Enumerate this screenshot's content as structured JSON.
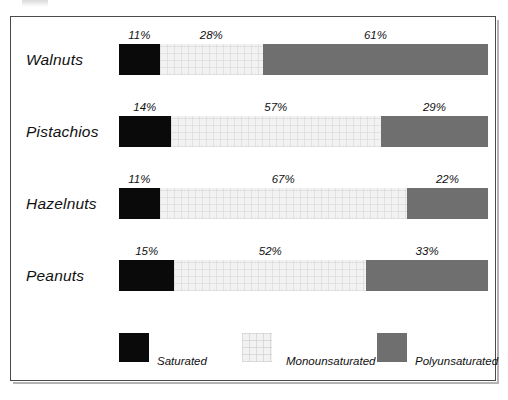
{
  "chart_data": {
    "type": "bar",
    "subtype": "stacked-horizontal-100-percent",
    "title": "",
    "xlabel": "",
    "ylabel": "",
    "xlim": [
      0,
      100
    ],
    "grid": false,
    "legend_position": "bottom",
    "value_suffix": "%",
    "categories": [
      "Walnuts",
      "Pistachios",
      "Hazelnuts",
      "Peanuts"
    ],
    "series": [
      {
        "name": "Saturated",
        "color": "#0a0a0a",
        "values": [
          11,
          14,
          11,
          15
        ]
      },
      {
        "name": "Monounsaturated",
        "color": "#f2f2f2",
        "values": [
          28,
          57,
          67,
          52
        ]
      },
      {
        "name": "Polyunsaturated",
        "color": "#6f6f6f",
        "values": [
          61,
          29,
          22,
          33
        ]
      }
    ],
    "data_labels": [
      {
        "category": "Walnuts",
        "labels": [
          "11%",
          "28%",
          "61%"
        ]
      },
      {
        "category": "Pistachios",
        "labels": [
          "14%",
          "57%",
          "29%"
        ]
      },
      {
        "category": "Hazelnuts",
        "labels": [
          "11%",
          "67%",
          "22%"
        ]
      },
      {
        "category": "Peanuts",
        "labels": [
          "15%",
          "52%",
          "33%"
        ]
      }
    ]
  },
  "rows": [
    {
      "label": "Walnuts",
      "segments": [
        {
          "series": "Saturated",
          "value": 11,
          "label": "11%"
        },
        {
          "series": "Monounsaturated",
          "value": 28,
          "label": "28%"
        },
        {
          "series": "Polyunsaturated",
          "value": 61,
          "label": "61%"
        }
      ]
    },
    {
      "label": "Pistachios",
      "segments": [
        {
          "series": "Saturated",
          "value": 14,
          "label": "14%"
        },
        {
          "series": "Monounsaturated",
          "value": 57,
          "label": "57%"
        },
        {
          "series": "Polyunsaturated",
          "value": 29,
          "label": "29%"
        }
      ]
    },
    {
      "label": "Hazelnuts",
      "segments": [
        {
          "series": "Saturated",
          "value": 11,
          "label": "11%"
        },
        {
          "series": "Monounsaturated",
          "value": 67,
          "label": "67%"
        },
        {
          "series": "Polyunsaturated",
          "value": 22,
          "label": "22%"
        }
      ]
    },
    {
      "label": "Peanuts",
      "segments": [
        {
          "series": "Saturated",
          "value": 15,
          "label": "15%"
        },
        {
          "series": "Monounsaturated",
          "value": 52,
          "label": "52%"
        },
        {
          "series": "Polyunsaturated",
          "value": 33,
          "label": "33%"
        }
      ]
    }
  ],
  "legend": {
    "items": [
      {
        "label": "Saturated",
        "color": "#0a0a0a",
        "swatch": "saturated-swatch"
      },
      {
        "label": "Monounsaturated",
        "color": "#f2f2f2",
        "swatch": "monounsaturated-swatch"
      },
      {
        "label": "Polyunsaturated",
        "color": "#6f6f6f",
        "swatch": "polyunsaturated-swatch"
      }
    ]
  },
  "colors": {
    "saturated": "#0a0a0a",
    "monounsaturated": "#f2f2f2",
    "polyunsaturated": "#6f6f6f",
    "frame_border": "#4a4a4a",
    "background": "#ffffff",
    "text": "#111111"
  }
}
